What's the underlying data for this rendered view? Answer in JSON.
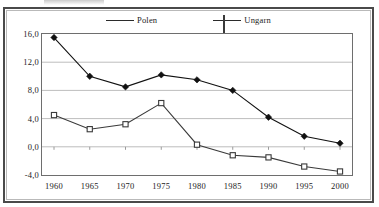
{
  "chart_data": {
    "type": "line",
    "title": "",
    "subtitle": "",
    "xlabel": "",
    "ylabel": "",
    "x": [
      1960,
      1965,
      1970,
      1975,
      1980,
      1985,
      1990,
      1995,
      2000
    ],
    "categories": [
      "1960",
      "1965",
      "1970",
      "1975",
      "1980",
      "1985",
      "1990",
      "1995",
      "2000"
    ],
    "xlim": [
      1958,
      2002
    ],
    "ylim": [
      -4.0,
      16.0
    ],
    "yticks": [
      16.0,
      12.0,
      8.0,
      4.0,
      0.0,
      -4.0
    ],
    "ytick_labels": [
      "16,0",
      "12,0",
      "8,0",
      "4,0",
      "0,0",
      "-4,0"
    ],
    "xtick_labels": [
      "1960",
      "1965",
      "1970",
      "1975",
      "1980",
      "1985",
      "1990",
      "1995",
      "2000"
    ],
    "grid": "horizontal",
    "legend_position": "top-center",
    "series": [
      {
        "name": "Polen",
        "marker": "filled-diamond",
        "color": "#111111",
        "values": [
          15.5,
          10.0,
          8.5,
          10.2,
          9.5,
          8.0,
          4.2,
          1.5,
          0.5
        ]
      },
      {
        "name": "Ungarn",
        "marker": "open-square",
        "color": "#3a3a3a",
        "values": [
          4.5,
          2.5,
          3.2,
          6.2,
          0.3,
          -1.2,
          -1.5,
          -2.8,
          -3.5
        ]
      }
    ]
  },
  "legend": {
    "entries": [
      {
        "label": "Polen",
        "marker": "filled-diamond"
      },
      {
        "label": "Ungarn",
        "marker": "open-square"
      }
    ]
  },
  "axes": {
    "y_labels": [
      "16,0",
      "12,0",
      "8,0",
      "4,0",
      "0,0",
      "-4,0"
    ],
    "x_labels": [
      "1960",
      "1965",
      "1970",
      "1975",
      "1980",
      "1985",
      "1990",
      "1995",
      "2000"
    ]
  },
  "colors": {
    "series_polen": "#111111",
    "series_ungarn": "#3a3a3a",
    "gridline": "#bdbdbd",
    "axis": "#6e6e6e",
    "frame_outer": "#4a4a4a",
    "frame_inner": "#b9b9b9",
    "text": "#1c1c1c",
    "background": "#ffffff"
  }
}
